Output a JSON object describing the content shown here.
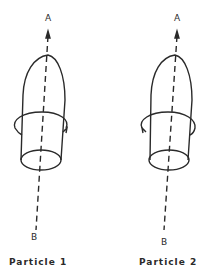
{
  "figure": {
    "particles": [
      {
        "id": 1,
        "caption": "Particle 1",
        "axis_top_label": "A",
        "axis_bottom_label": "B",
        "rotation_arrow_side": "right"
      },
      {
        "id": 2,
        "caption": "Particle 2",
        "axis_top_label": "A",
        "axis_bottom_label": "B",
        "rotation_arrow_side": "left"
      }
    ],
    "colors": {
      "stroke": "#2a2a2a",
      "background": "#ffffff"
    }
  }
}
